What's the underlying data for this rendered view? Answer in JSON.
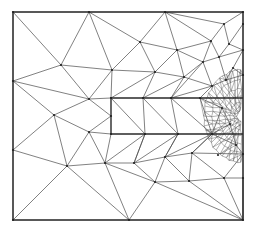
{
  "diagram": {
    "type": "triangular-mesh",
    "stroke_color": "#4a4a4a",
    "border_color": "#222222",
    "outer_boundary": {
      "x1": 13,
      "y1": 12,
      "x2": 243,
      "y2": 220
    },
    "inner_slot": {
      "x1": 111,
      "y1": 98,
      "x2": 243,
      "y2": 134
    },
    "refinement_center": [
      241,
      116
    ],
    "nodes": [
      [
        13,
        12
      ],
      [
        89,
        12
      ],
      [
        165,
        12
      ],
      [
        243,
        12
      ],
      [
        13,
        81
      ],
      [
        13,
        150
      ],
      [
        13,
        220
      ],
      [
        129,
        220
      ],
      [
        243,
        220
      ],
      [
        243,
        24
      ],
      [
        243,
        50
      ],
      [
        243,
        75
      ],
      [
        243,
        154
      ],
      [
        243,
        178
      ],
      [
        61,
        65
      ],
      [
        140,
        42
      ],
      [
        112,
        70
      ],
      [
        155,
        72
      ],
      [
        177,
        50
      ],
      [
        211,
        41
      ],
      [
        224,
        24
      ],
      [
        184,
        77
      ],
      [
        203,
        62
      ],
      [
        219,
        57
      ],
      [
        229,
        44
      ],
      [
        89,
        99
      ],
      [
        54,
        115
      ],
      [
        89,
        132
      ],
      [
        111,
        98
      ],
      [
        143,
        98
      ],
      [
        171,
        98
      ],
      [
        200,
        98
      ],
      [
        111,
        116
      ],
      [
        111,
        134
      ],
      [
        145,
        134
      ],
      [
        178,
        134
      ],
      [
        212,
        134
      ],
      [
        67,
        166
      ],
      [
        105,
        163
      ],
      [
        134,
        163
      ],
      [
        165,
        157
      ],
      [
        192,
        153
      ],
      [
        218,
        155
      ],
      [
        155,
        182
      ],
      [
        189,
        181
      ],
      [
        224,
        178
      ],
      [
        212,
        86
      ],
      [
        226,
        80
      ],
      [
        233,
        68
      ],
      [
        222,
        108
      ],
      [
        230,
        124
      ],
      [
        236,
        145
      ]
    ],
    "edges": [
      [
        0,
        14
      ],
      [
        1,
        14
      ],
      [
        1,
        15
      ],
      [
        1,
        16
      ],
      [
        2,
        15
      ],
      [
        2,
        18
      ],
      [
        2,
        20
      ],
      [
        2,
        19
      ],
      [
        4,
        14
      ],
      [
        4,
        25
      ],
      [
        4,
        26
      ],
      [
        14,
        16
      ],
      [
        14,
        25
      ],
      [
        16,
        25
      ],
      [
        16,
        15
      ],
      [
        15,
        17
      ],
      [
        15,
        18
      ],
      [
        16,
        17
      ],
      [
        17,
        18
      ],
      [
        18,
        19
      ],
      [
        19,
        20
      ],
      [
        19,
        23
      ],
      [
        20,
        3
      ],
      [
        20,
        24
      ],
      [
        19,
        22
      ],
      [
        18,
        22
      ],
      [
        18,
        21
      ],
      [
        17,
        21
      ],
      [
        21,
        22
      ],
      [
        22,
        23
      ],
      [
        23,
        24
      ],
      [
        24,
        9
      ],
      [
        23,
        10
      ],
      [
        24,
        10
      ],
      [
        16,
        28
      ],
      [
        17,
        28
      ],
      [
        17,
        29
      ],
      [
        21,
        29
      ],
      [
        21,
        30
      ],
      [
        22,
        30
      ],
      [
        22,
        46
      ],
      [
        21,
        46
      ],
      [
        23,
        47
      ],
      [
        46,
        47
      ],
      [
        47,
        48
      ],
      [
        48,
        10
      ],
      [
        48,
        11
      ],
      [
        47,
        11
      ],
      [
        25,
        28
      ],
      [
        25,
        32
      ],
      [
        25,
        26
      ],
      [
        26,
        27
      ],
      [
        26,
        5
      ],
      [
        5,
        37
      ],
      [
        27,
        32
      ],
      [
        27,
        33
      ],
      [
        27,
        37
      ],
      [
        27,
        38
      ],
      [
        26,
        37
      ],
      [
        37,
        6
      ],
      [
        37,
        7
      ],
      [
        38,
        7
      ],
      [
        38,
        33
      ],
      [
        38,
        34
      ],
      [
        38,
        39
      ],
      [
        39,
        34
      ],
      [
        39,
        35
      ],
      [
        39,
        40
      ],
      [
        40,
        35
      ],
      [
        40,
        36
      ],
      [
        40,
        41
      ],
      [
        41,
        36
      ],
      [
        41,
        12
      ],
      [
        34,
        39
      ],
      [
        35,
        40
      ],
      [
        36,
        41
      ],
      [
        37,
        38
      ],
      [
        39,
        43
      ],
      [
        40,
        43
      ],
      [
        43,
        44
      ],
      [
        40,
        44
      ],
      [
        44,
        41
      ],
      [
        41,
        45
      ],
      [
        44,
        45
      ],
      [
        45,
        12
      ],
      [
        45,
        13
      ],
      [
        43,
        7
      ],
      [
        43,
        8
      ],
      [
        44,
        8
      ],
      [
        45,
        8
      ],
      [
        13,
        8
      ],
      [
        38,
        43
      ],
      [
        28,
        34
      ],
      [
        29,
        34
      ],
      [
        29,
        35
      ],
      [
        30,
        35
      ],
      [
        30,
        36
      ],
      [
        31,
        36
      ],
      [
        31,
        46
      ],
      [
        30,
        46
      ],
      [
        31,
        49
      ],
      [
        49,
        36
      ],
      [
        49,
        50
      ],
      [
        50,
        36
      ],
      [
        50,
        51
      ],
      [
        51,
        12
      ],
      [
        36,
        51
      ]
    ],
    "fine_mesh": {
      "region": {
        "x1": 205,
        "y1": 60,
        "x2": 243,
        "y2": 150
      },
      "density": "high"
    }
  }
}
